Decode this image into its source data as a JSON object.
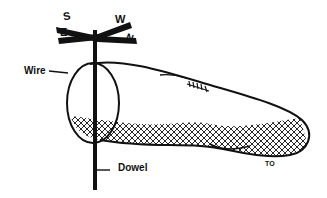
{
  "figure": {
    "labels": {
      "wire": "Wire",
      "dowel": "Dowel",
      "to": "TO"
    },
    "compass": {
      "north": "N",
      "south": "S",
      "east": "E",
      "west": "W"
    },
    "colors": {
      "ink": "#111111",
      "background": "#ffffff"
    }
  }
}
